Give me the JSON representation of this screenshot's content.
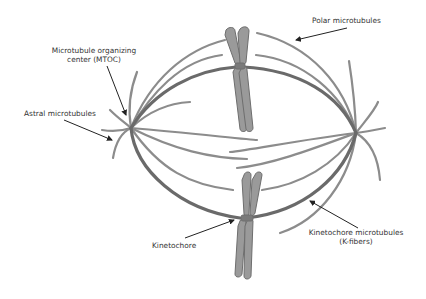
{
  "diagram": {
    "labels": {
      "polar": "Polar microtubules",
      "mtoc_line1": "Microtubule organizing",
      "mtoc_line2": "center (MTOC)",
      "astral": "Astral microtubules",
      "kinetochore": "Kinetochore",
      "kfibers_line1": "Kinetochore microtubules",
      "kfibers_line2": "(K-fibers)"
    },
    "colors": {
      "microtubule": "#8c8c8c",
      "kfiber": "#6a6a6a",
      "chromosome_fill": "#9a9a9a",
      "chromosome_stroke": "#6e6e6e",
      "arrow": "#222222",
      "text": "#333333"
    },
    "poles": [
      {
        "name": "left-mtoc",
        "x": 131,
        "y": 128
      },
      {
        "name": "right-mtoc",
        "x": 356,
        "y": 133
      }
    ],
    "chromosomes": [
      {
        "name": "upper-chromosome",
        "centromere_x": 239,
        "centromere_y": 66
      },
      {
        "name": "lower-chromosome",
        "centromere_x": 243,
        "centromere_y": 218
      }
    ]
  }
}
